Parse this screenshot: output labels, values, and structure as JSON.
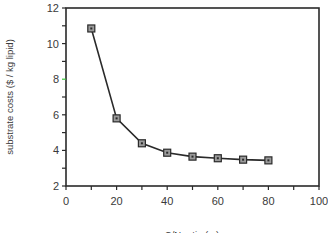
{
  "chart_data": {
    "type": "line",
    "title": "",
    "xlabel": "C/N ratio (...)",
    "ylabel": "substrate costs ($ / kg lipid)",
    "xlim": [
      0,
      100
    ],
    "ylim": [
      2,
      12
    ],
    "x_ticks": [
      0,
      20,
      40,
      60,
      80,
      100
    ],
    "y_ticks": [
      2,
      4,
      6,
      8,
      10,
      12
    ],
    "x_minor_step": 10,
    "y_minor_step": 1,
    "grid": false,
    "legend": null,
    "marker": "square",
    "series": [
      {
        "name": "substrate costs",
        "x": [
          10,
          20,
          30,
          40,
          50,
          60,
          70,
          80
        ],
        "values": [
          10.85,
          5.8,
          4.4,
          3.87,
          3.65,
          3.56,
          3.48,
          3.44
        ]
      }
    ]
  },
  "colors": {
    "axis": "#2a2a2a",
    "line": "#2a2a2a",
    "marker_fill": "#9a9a9a",
    "highlight_tick": "#3cc43c"
  },
  "plot_box": {
    "left": 66,
    "top": 8,
    "right": 319,
    "bottom": 186
  }
}
